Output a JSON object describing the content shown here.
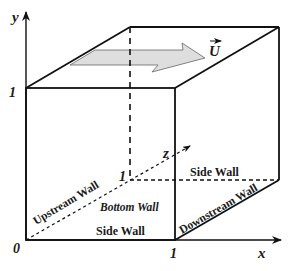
{
  "axes": {
    "x_label": "x",
    "y_label": "y",
    "z_label": "z",
    "origin_label": "0",
    "x_tick": "1",
    "y_tick": "1",
    "z_tick": "1"
  },
  "velocity_label": "U",
  "walls": {
    "upstream": "Upstream Wall",
    "bottom": "Bottom Wall",
    "side_front": "Side Wall",
    "side_back": "Side Wall",
    "downstream": "Downstream Wall"
  },
  "colors": {
    "lines": "#111111",
    "arrow_fill": "#dedede",
    "arrow_stroke": "#555555"
  }
}
